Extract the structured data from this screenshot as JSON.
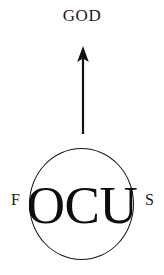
{
  "diagram": {
    "title_text": "GOD",
    "arrow": {
      "icon": "up-arrow-icon",
      "direction": "up",
      "color": "#111111"
    },
    "focus_word": {
      "prefix_letter": "F",
      "circled_letters": "OCU",
      "suffix_letter": "S",
      "full_word": "FOCUS"
    },
    "shapes": {
      "circle": {
        "icon": "circle-outline",
        "stroke_color": "#141414"
      }
    },
    "colors": {
      "background": "#ffffff",
      "ink": "#111111"
    }
  }
}
